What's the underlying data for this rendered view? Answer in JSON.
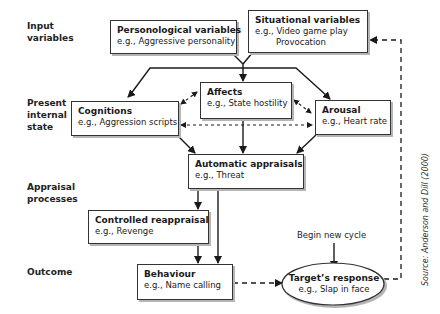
{
  "stages": [
    {
      "id": "input",
      "label_line1": "Input",
      "label_line2": "variables",
      "label_line3": ""
    },
    {
      "id": "present",
      "label_line1": "Present",
      "label_line2": "internal",
      "label_line3": "state"
    },
    {
      "id": "appraisal",
      "label_line1": "Appraisal",
      "label_line2": "processes",
      "label_line3": ""
    },
    {
      "id": "outcome",
      "label_line1": "Outcome",
      "label_line2": "",
      "label_line3": ""
    }
  ],
  "nodes": {
    "personological": {
      "title": "Personological variables",
      "example": "e.g., Aggressive personality"
    },
    "situational": {
      "title": "Situational variables",
      "example": "e.g., Video game play",
      "example2": "Provocation"
    },
    "affects": {
      "title": "Affects",
      "example": "e.g., State hostility"
    },
    "cognitions": {
      "title": "Cognitions",
      "example": "e.g., Aggression scripts"
    },
    "arousal": {
      "title": "Arousal",
      "example": "e.g.,  Heart rate"
    },
    "automatic": {
      "title": "Automatic appraisals",
      "example": "e.g.,  Threat"
    },
    "controlled": {
      "title": "Controlled reappraisal",
      "example": "e.g.,  Revenge"
    },
    "behaviour": {
      "title": "Behaviour",
      "example": "e.g., Name calling"
    },
    "target": {
      "title": "Target’s response",
      "example": "e.g.,  Slap in face"
    }
  },
  "cycle_label": "Begin new cycle",
  "source": "Source: Anderson and Dill (2000)",
  "colors": {
    "line": "#1a1a1a",
    "box_border": "#333333",
    "shadow": "#b5b5b5",
    "background": "#ffffff"
  }
}
